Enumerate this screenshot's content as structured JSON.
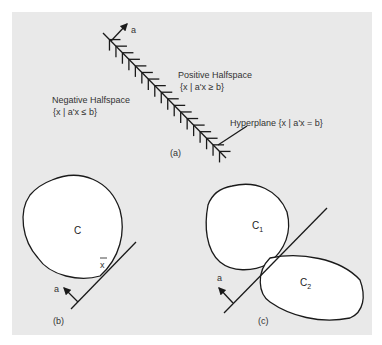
{
  "figure": {
    "panel_a": {
      "caption": "(a)",
      "normal_label": "a",
      "positive_title": "Positive Halfspace",
      "positive_set": "{x | a'x ≥ b}",
      "negative_title": "Negative Halfspace",
      "negative_set": "{x | a'x ≤ b}",
      "hyperplane_label": "Hyperplane  {x | a'x = b}"
    },
    "panel_b": {
      "caption": "(b)",
      "set_label": "C",
      "point_label": "x",
      "normal_label": "a"
    },
    "panel_c": {
      "caption": "(c)",
      "set1_label": "C",
      "set1_sub": "1",
      "set2_label": "C",
      "set2_sub": "2",
      "normal_label": "a"
    },
    "colors": {
      "background": "#e9e9e9",
      "ink": "#1a1a1a",
      "set_fill": "#ffffff"
    }
  }
}
